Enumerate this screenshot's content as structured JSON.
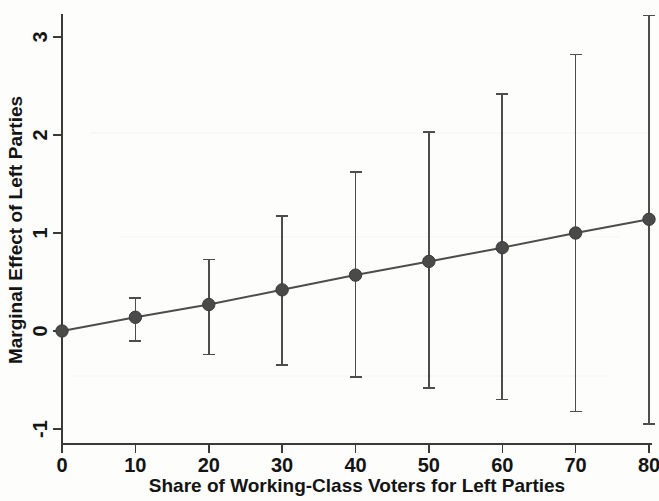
{
  "chart_data": {
    "type": "line",
    "title": "",
    "subtitle": "",
    "xlabel": "Share of Working-Class Voters for Left Parties",
    "ylabel": "Marginal Effect of Left Parties",
    "x": [
      0,
      10,
      20,
      30,
      40,
      50,
      60,
      70,
      80
    ],
    "values": [
      0.0,
      0.14,
      0.27,
      0.42,
      0.57,
      0.71,
      0.85,
      1.0,
      1.14
    ],
    "ci_lower": [
      0.0,
      -0.1,
      -0.24,
      -0.35,
      -0.47,
      -0.58,
      -0.7,
      -0.82,
      -0.95
    ],
    "ci_upper": [
      0.0,
      0.34,
      0.73,
      1.17,
      1.62,
      2.03,
      2.42,
      2.82,
      3.22
    ],
    "series": [
      {
        "name": "Marginal Effect of Left Parties",
        "values": [
          0.0,
          0.14,
          0.27,
          0.42,
          0.57,
          0.71,
          0.85,
          1.0,
          1.14
        ]
      }
    ],
    "xlim": [
      -3,
      82
    ],
    "ylim": [
      -1.35,
      3.35
    ],
    "xticks": [
      0,
      10,
      20,
      30,
      40,
      50,
      60,
      70,
      80
    ],
    "xtick_labels": [
      "0",
      "10",
      "20",
      "30",
      "40",
      "50",
      "60",
      "70",
      "80"
    ],
    "yticks": [
      -1,
      0,
      1,
      2,
      3
    ],
    "ytick_labels": [
      "-1",
      "0",
      "1",
      "2",
      "3"
    ],
    "grid": false,
    "legend": "none",
    "marker": "filled-circle",
    "errorbar_style": "capped-vertical",
    "line_color": "#4d4d4d",
    "marker_color": "#4a4a4a",
    "axis_color": "#3a3a3a",
    "background_color": "#fdfdfc"
  }
}
